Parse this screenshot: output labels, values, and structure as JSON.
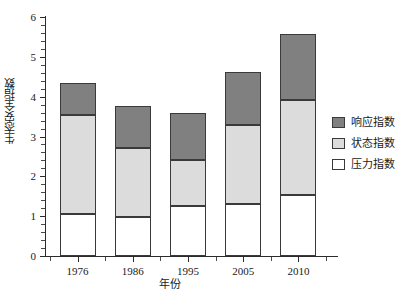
{
  "chart_data": {
    "type": "bar",
    "subtype": "stacked-bar",
    "title": "",
    "xlabel": "年份",
    "ylabel": "生态安全指数",
    "categories": [
      "1976",
      "1986",
      "1995",
      "2005",
      "2010"
    ],
    "series": [
      {
        "name": "压力指数",
        "values": [
          1.05,
          0.97,
          1.25,
          1.3,
          1.52
        ],
        "color": "#ffffff"
      },
      {
        "name": "状态指数",
        "values": [
          2.5,
          1.75,
          1.15,
          1.98,
          2.4
        ],
        "color": "#dcdcdc"
      },
      {
        "name": "响应指数",
        "values": [
          0.8,
          1.05,
          1.2,
          1.35,
          1.65
        ],
        "color": "#808080"
      }
    ],
    "totals": [
      4.35,
      3.78,
      3.6,
      4.63,
      5.57
    ],
    "ylim": [
      0,
      6
    ],
    "yticks": [
      0,
      1,
      2,
      3,
      4,
      5,
      6
    ],
    "ytick_labels": [
      "0",
      "1",
      "2",
      "3",
      "4",
      "5",
      "6"
    ],
    "y_minor_step": 0.2,
    "grid": false,
    "legend_position": "right",
    "legend_entries": [
      "响应指数",
      "状态指数",
      "压力指数"
    ],
    "axis_color": "#2b2b2b",
    "bar_edge_color": "#3a3a3a",
    "background": "#ffffff"
  },
  "axes": {
    "y_title": "生态安全指数",
    "x_title": "年份",
    "y_tick_labels": [
      "0",
      "1",
      "2",
      "3",
      "4",
      "5",
      "6"
    ],
    "x_tick_labels": [
      "1976",
      "1986",
      "1995",
      "2005",
      "2010"
    ]
  },
  "legend": {
    "items": [
      {
        "label": "响应指数",
        "color": "#808080"
      },
      {
        "label": "状态指数",
        "color": "#dcdcdc"
      },
      {
        "label": "压力指数",
        "color": "#ffffff"
      }
    ]
  }
}
